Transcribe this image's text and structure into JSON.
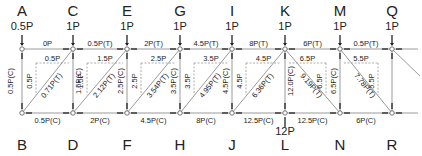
{
  "diagram": {
    "type": "truss free-body diagram",
    "top_nodes": [
      {
        "id": "A",
        "x": 22,
        "load": "0.5P"
      },
      {
        "id": "C",
        "x": 73,
        "load": "1P"
      },
      {
        "id": "E",
        "x": 127,
        "load": "1P"
      },
      {
        "id": "G",
        "x": 180,
        "load": "1P"
      },
      {
        "id": "I",
        "x": 232,
        "load": "1P"
      },
      {
        "id": "K",
        "x": 285,
        "load": "1P"
      },
      {
        "id": "M",
        "x": 340,
        "load": "1P"
      },
      {
        "id": "Q",
        "x": 392,
        "load": "1P"
      }
    ],
    "bottom_nodes": [
      {
        "id": "B",
        "x": 22
      },
      {
        "id": "D",
        "x": 73
      },
      {
        "id": "F",
        "x": 127
      },
      {
        "id": "H",
        "x": 180
      },
      {
        "id": "J",
        "x": 232
      },
      {
        "id": "L",
        "x": 285,
        "load": "12P"
      },
      {
        "id": "N",
        "x": 340
      },
      {
        "id": "R",
        "x": 392
      }
    ],
    "top_chord": [
      {
        "from": "A",
        "to": "C",
        "force": "0P"
      },
      {
        "from": "C",
        "to": "E",
        "force": "0.5P(T)"
      },
      {
        "from": "E",
        "to": "G",
        "force": "2P(T)"
      },
      {
        "from": "G",
        "to": "I",
        "force": "4.5P(T)"
      },
      {
        "from": "I",
        "to": "K",
        "force": "8P(T)"
      },
      {
        "from": "K",
        "to": "M",
        "force": "6P(T)"
      },
      {
        "from": "M",
        "to": "Q",
        "force": "0.5P(T)"
      }
    ],
    "bottom_chord": [
      {
        "from": "B",
        "to": "D",
        "force": "0.5P(C)"
      },
      {
        "from": "D",
        "to": "F",
        "force": "2P(C)"
      },
      {
        "from": "F",
        "to": "H",
        "force": "4.5P(C)"
      },
      {
        "from": "H",
        "to": "J",
        "force": "8P(C)"
      },
      {
        "from": "J",
        "to": "L",
        "force": "12.5P(C)"
      },
      {
        "from": "L",
        "to": "N",
        "force": "12.5P(C)"
      },
      {
        "from": "N",
        "to": "R",
        "force": "6P(C)"
      }
    ],
    "verticals": [
      {
        "at": "A-B",
        "force": "0.5P(C)"
      },
      {
        "at": "C-D",
        "force": "1.5P(C)"
      },
      {
        "at": "E-F",
        "force": "2.5P(C)"
      },
      {
        "at": "G-H",
        "force": "3.5P(C)"
      },
      {
        "at": "I-J",
        "force": "4.5P(C)"
      },
      {
        "at": "K-L",
        "force": "12.0P(C)"
      },
      {
        "at": "M-N",
        "force": "6.5P(C)"
      }
    ],
    "diagonals": [
      {
        "from": "B",
        "to": "C",
        "force": "0.71P(T)",
        "h": "0.5P",
        "v": "0.5P"
      },
      {
        "from": "D",
        "to": "E",
        "force": "2.12P(T)",
        "h": "1.5P",
        "v": "1.5P"
      },
      {
        "from": "F",
        "to": "G",
        "force": "3.54P(T)",
        "h": "2.5P",
        "v": "2.5P"
      },
      {
        "from": "H",
        "to": "I",
        "force": "4.95P(T)",
        "h": "3.5P",
        "v": "3.5P"
      },
      {
        "from": "J",
        "to": "K",
        "force": "6.36P(T)",
        "h": "4.5P",
        "v": "4.5P"
      },
      {
        "from": "K",
        "to": "N",
        "force": "9.19P(T)",
        "h": "6.5P",
        "v": "6.5P"
      },
      {
        "from": "M",
        "to": "R",
        "force": "7.78P(T)",
        "h": "5.5P",
        "v": "5.5P"
      }
    ]
  }
}
